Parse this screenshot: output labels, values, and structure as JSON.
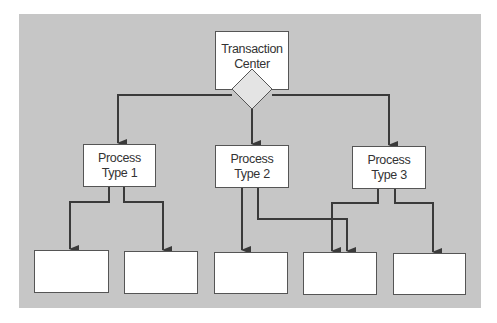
{
  "diagram": {
    "background_color": "#c6c6c6",
    "line_color": "#3a3a3a",
    "root": {
      "label_line1": "Transaction",
      "label_line2": "Center",
      "connector": "diamond"
    },
    "processes": [
      {
        "label_line1": "Process",
        "label_line2": "Type 1"
      },
      {
        "label_line1": "Process",
        "label_line2": "Type 2"
      },
      {
        "label_line1": "Process",
        "label_line2": "Type 3"
      }
    ],
    "leaf_boxes": [
      {
        "label": ""
      },
      {
        "label": ""
      },
      {
        "label": ""
      },
      {
        "label": ""
      },
      {
        "label": ""
      }
    ]
  }
}
